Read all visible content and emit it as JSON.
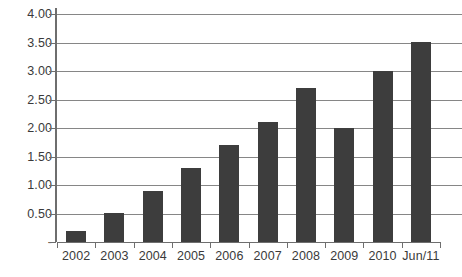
{
  "chart_data": {
    "type": "bar",
    "title": "",
    "subtitle": "",
    "xlabel": "",
    "ylabel": "",
    "categories": [
      "2002",
      "2003",
      "2004",
      "2005",
      "2006",
      "2007",
      "2008",
      "2009",
      "2010",
      "Jun/11"
    ],
    "values": [
      0.2,
      0.5,
      0.9,
      1.3,
      1.7,
      2.1,
      2.7,
      2.0,
      3.0,
      3.5
    ],
    "ylim": [
      0,
      4.0
    ],
    "ytick_values": [
      0,
      0.5,
      1.0,
      1.5,
      2.0,
      2.5,
      3.0,
      3.5,
      4.0
    ],
    "ytick_labels": [
      "-",
      "0.50",
      "1.00",
      "1.50",
      "2.00",
      "2.50",
      "3.00",
      "3.50",
      "4.00"
    ],
    "grid": true,
    "legend": false,
    "legend_position": "none",
    "bar_color": "#3d3d3d",
    "gridline_color": "#868686",
    "axis_color": "#6e6e6e",
    "text_color": "#3a3a3a",
    "background_color": "#ffffff"
  }
}
